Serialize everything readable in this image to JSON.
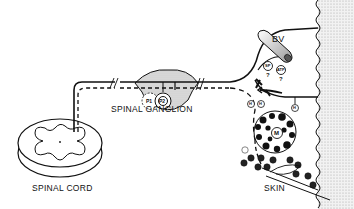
{
  "labels": {
    "spinal_cord": "SPINAL CORD",
    "spinal_ganglion": "SPINAL GANGLION",
    "blood_vessel": "BV",
    "skin": "SKIN",
    "mast_cell": "M",
    "ganglion_cell_1": "P1",
    "ganglion_cell_2": "P2",
    "substance_p": "SP",
    "atp": "ATP",
    "unknown_1": "?",
    "unknown_2": "?",
    "histamine": "H"
  },
  "colors": {
    "line": "#111111",
    "shade": "#c8c8c8",
    "background": "#ffffff"
  }
}
